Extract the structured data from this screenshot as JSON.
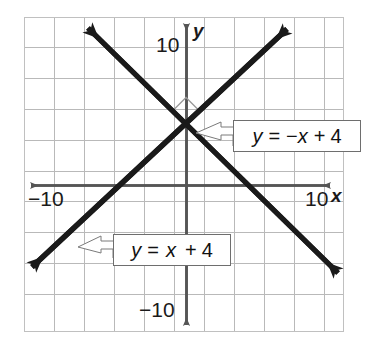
{
  "figure": {
    "type": "coordinate-graph",
    "background": "#ffffff",
    "frame": {
      "x": 24,
      "y": 17,
      "width": 320,
      "height": 315,
      "border_color": "#c8c8c8"
    },
    "grid": {
      "spacing_px": 30,
      "columns": 10,
      "rows": 10,
      "color": "#b4b4b4",
      "units_per_cell": 2
    },
    "axes": {
      "origin_px": {
        "x": 186,
        "y": 185
      },
      "unit_px": 15,
      "color": "#555555",
      "x_axis": {
        "label": "x",
        "arrows": "both"
      },
      "y_axis": {
        "label": "y",
        "arrows": "both"
      }
    },
    "tick_labels": {
      "y_positive": "10",
      "y_negative": "−10",
      "x_positive": "10",
      "x_negative": "−10"
    },
    "axis_labels": {
      "x": "x",
      "y": "y"
    },
    "right_angle_marker": {
      "present": true,
      "at_px": {
        "x": 186,
        "y": 125
      }
    },
    "lines": [
      {
        "name": "line-y-equals-minus-x-plus-4",
        "equation": "y = −x + 4",
        "slope": -1,
        "intercept": 4,
        "color": "#1a1a1a",
        "arrows": "both",
        "start_px": {
          "x": 82,
          "y": 22
        },
        "end_px": {
          "x": 343,
          "y": 278
        }
      },
      {
        "name": "line-y-equals-x-plus-4",
        "equation": "y = x + 4",
        "slope": 1,
        "intercept": 4,
        "color": "#1a1a1a",
        "arrows": "both",
        "start_px": {
          "x": 26,
          "y": 272
        },
        "end_px": {
          "x": 292,
          "y": 23
        }
      }
    ],
    "callouts": [
      {
        "name": "callout-negative-slope",
        "parts": {
          "y": "y",
          "eq": "=",
          "neg": "−",
          "x": "x",
          "plus": "+",
          "const": "4"
        },
        "text": "y = −x + 4",
        "box_px": {
          "x": 233,
          "y": 120,
          "width": 128,
          "height": 32
        },
        "pointer_to_px": {
          "x": 196,
          "y": 134
        }
      },
      {
        "name": "callout-positive-slope",
        "parts": {
          "y": "y",
          "eq": "=",
          "x": "x",
          "plus": "+",
          "const": "4"
        },
        "text": "y = x + 4",
        "box_px": {
          "x": 113,
          "y": 234,
          "width": 118,
          "height": 32
        },
        "pointer_to_px": {
          "x": 78,
          "y": 246
        }
      }
    ]
  }
}
